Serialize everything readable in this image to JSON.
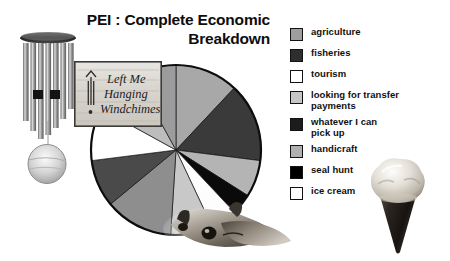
{
  "title": {
    "line1": "PEI : Complete Economic",
    "line2": "Breakdown",
    "full": "PEI : Complete Economic Breakdown"
  },
  "logo": {
    "line1": "Left Me",
    "line2": "Hanging",
    "line3": "Windchimes",
    "alt": "Left Me Hanging Windchimes wooden sign"
  },
  "photos": {
    "windchime_alt": "windchime",
    "seal_alt": "seal",
    "cone_alt": "ice cream cone"
  },
  "legend": {
    "items": [
      {
        "label": "agriculture",
        "color": "#9e9e9e"
      },
      {
        "label": "fisheries",
        "color": "#2e2e2e"
      },
      {
        "label": "tourism",
        "color": "#ffffff"
      },
      {
        "label": "looking for transfer\npayments",
        "color": "#c6c6c6"
      },
      {
        "label": "whatever I can\npick up",
        "color": "#1c1c1c"
      },
      {
        "label": "handicraft",
        "color": "#b0b0b0"
      },
      {
        "label": "seal hunt",
        "color": "#000000"
      },
      {
        "label": "ice cream",
        "color": "#ffffff"
      }
    ]
  },
  "chart_data": {
    "type": "pie",
    "title": "PEI : Complete Economic Breakdown",
    "legend_position": "right",
    "grid": false,
    "start_angle_deg": 0,
    "direction": "clockwise",
    "center": {
      "x": 90,
      "y": 88
    },
    "radius": 85,
    "categories": [
      "agriculture",
      "fisheries",
      "handicraft",
      "seal hunt",
      "tourism",
      "looking for transfer payments",
      "whatever I can pick up",
      "ice cream"
    ],
    "slices": [
      {
        "label": "agriculture",
        "value": 12.0,
        "color": "#a8a8a8",
        "start_deg": 0.0,
        "end_deg": 43.2
      },
      {
        "label": "fisheries",
        "value": 15.0,
        "color": "#3a3a3a",
        "start_deg": 43.2,
        "end_deg": 97.2
      },
      {
        "label": "handicraft",
        "value": 7.0,
        "color": "#b4b4b4",
        "start_deg": 97.2,
        "end_deg": 122.4
      },
      {
        "label": "seal hunt",
        "value": 4.0,
        "color": "#0a0a0a",
        "start_deg": 122.4,
        "end_deg": 136.8
      },
      {
        "label": "ice cream",
        "value": 5.0,
        "color": "#fdfdfd",
        "start_deg": 136.8,
        "end_deg": 154.8
      },
      {
        "label": "looking for transfer payments",
        "value": 8.0,
        "color": "#c8c8c8",
        "start_deg": 154.8,
        "end_deg": 183.6
      },
      {
        "label": "whatever I can pick up",
        "value": 13.0,
        "color": "#8e8e8e",
        "start_deg": 183.6,
        "end_deg": 230.4
      },
      {
        "label": "fisheries (lower)",
        "value": 9.0,
        "color": "#4a4a4a",
        "start_deg": 230.4,
        "end_deg": 262.8
      },
      {
        "label": "tourism",
        "value": 10.0,
        "color": "#ffffff",
        "start_deg": 262.8,
        "end_deg": 298.8
      },
      {
        "label": "handicraft (lower)",
        "value": 9.0,
        "color": "#bdbdbd",
        "start_deg": 298.8,
        "end_deg": 331.2
      },
      {
        "label": "agriculture (upper-left)",
        "value": 8.0,
        "color": "#9c9c9c",
        "start_deg": 331.2,
        "end_deg": 360.0
      }
    ],
    "outline_color": "#0d0d0d",
    "outline_width": 2.2
  }
}
